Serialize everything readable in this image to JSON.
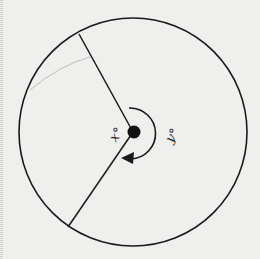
{
  "diagram": {
    "type": "circle-angle",
    "labels": {
      "x_angle": "x°",
      "y_angle": "y°"
    },
    "colors": {
      "background": "#efefed",
      "stroke": "#1a1a1a",
      "pencil_mark": "#a8a8a8"
    }
  }
}
